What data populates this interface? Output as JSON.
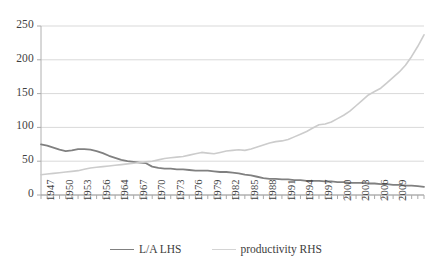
{
  "chart_data": {
    "type": "line",
    "title": "",
    "subtitle": "",
    "xlabel": "",
    "ylabel": "",
    "grid": true,
    "legend_position": "bottom",
    "ylim": [
      0,
      250
    ],
    "yticks": [
      0,
      50,
      100,
      150,
      200,
      250
    ],
    "xlim": [
      1947,
      2009
    ],
    "xtick_labels": [
      "1947",
      "1950",
      "1953",
      "1956",
      "1964",
      "1967",
      "1970",
      "1973",
      "1976",
      "1979",
      "1982",
      "1985",
      "1988",
      "1991",
      "1994",
      "1997",
      "2000",
      "2003",
      "2006",
      "2009"
    ],
    "xtick_step_years": 3,
    "x": [
      1947,
      1948,
      1949,
      1950,
      1951,
      1952,
      1953,
      1954,
      1955,
      1956,
      1957,
      1958,
      1959,
      1960,
      1961,
      1962,
      1963,
      1964,
      1965,
      1966,
      1967,
      1968,
      1969,
      1970,
      1971,
      1972,
      1973,
      1974,
      1975,
      1976,
      1977,
      1978,
      1979,
      1980,
      1981,
      1982,
      1983,
      1984,
      1985,
      1986,
      1987,
      1988,
      1989,
      1990,
      1991,
      1992,
      1993,
      1994,
      1995,
      1996,
      1997,
      1998,
      1999,
      2000,
      2001,
      2002,
      2003,
      2004,
      2005,
      2006,
      2007,
      2008,
      2009
    ],
    "series": [
      {
        "name": "L/A LHS",
        "axis": "left",
        "color": "#808080",
        "values": [
          75,
          73,
          70,
          67,
          65,
          66,
          68,
          68,
          67,
          65,
          62,
          58,
          55,
          52,
          50,
          49,
          48,
          47,
          42,
          40,
          39,
          39,
          38,
          38,
          37,
          36,
          36,
          36,
          35,
          34,
          34,
          33,
          32,
          30,
          29,
          27,
          25,
          24,
          24,
          23,
          23,
          22,
          22,
          21,
          21,
          21,
          20,
          20,
          19,
          19,
          18,
          18,
          18,
          17,
          17,
          16,
          16,
          15,
          15,
          14,
          14,
          13,
          12
        ]
      },
      {
        "name": "productivity RHS",
        "axis": "right",
        "color": "#cccccc",
        "values": [
          30,
          31,
          32,
          33,
          34,
          35,
          36,
          38,
          40,
          41,
          42,
          43,
          44,
          45,
          46,
          47,
          48,
          49,
          50,
          52,
          54,
          55,
          56,
          57,
          59,
          61,
          63,
          62,
          61,
          63,
          65,
          66,
          67,
          66,
          68,
          71,
          74,
          77,
          79,
          80,
          82,
          86,
          90,
          94,
          99,
          104,
          105,
          108,
          113,
          118,
          124,
          132,
          140,
          148,
          153,
          158,
          166,
          174,
          182,
          192,
          205,
          220,
          237
        ]
      }
    ]
  },
  "legend": {
    "items": [
      {
        "label": "L/A LHS",
        "color": "#808080"
      },
      {
        "label": "productivity RHS",
        "color": "#d4d4d4"
      }
    ]
  },
  "axes": {
    "y_tick_labels": [
      "250",
      "200",
      "150",
      "100",
      "50",
      "0"
    ],
    "x_tick_labels": [
      "1947",
      "1950",
      "1953",
      "1956",
      "1964",
      "1967",
      "1970",
      "1973",
      "1976",
      "1979",
      "1982",
      "1985",
      "1988",
      "1991",
      "1994",
      "1997",
      "2000",
      "2003",
      "2006",
      "2009"
    ]
  }
}
